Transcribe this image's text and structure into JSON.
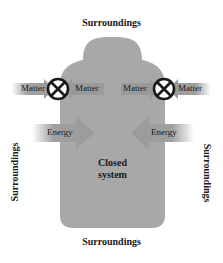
{
  "diagram": {
    "title": "Closed system",
    "system_label_line1": "Closed",
    "system_label_line2": "system",
    "surroundings": {
      "top": "Surroundings",
      "bottom": "Surroundings",
      "left": "Surroundings",
      "right": "Surroundings"
    },
    "matter_flows": {
      "left_outer": "Matter",
      "left_inner": "Matter",
      "right_inner": "Matter",
      "right_outer": "Matter",
      "blocked_icon": "circle-x-icon"
    },
    "energy_flows": {
      "left": "Energy",
      "right": "Energy"
    },
    "colors": {
      "system_fill": "#a8a8a8",
      "arrow_fill": "#9a9a9a",
      "arrow_fade": "#e6e6e6",
      "text": "#1a1a1a",
      "blocked_circle": "#1a1a1a"
    }
  }
}
